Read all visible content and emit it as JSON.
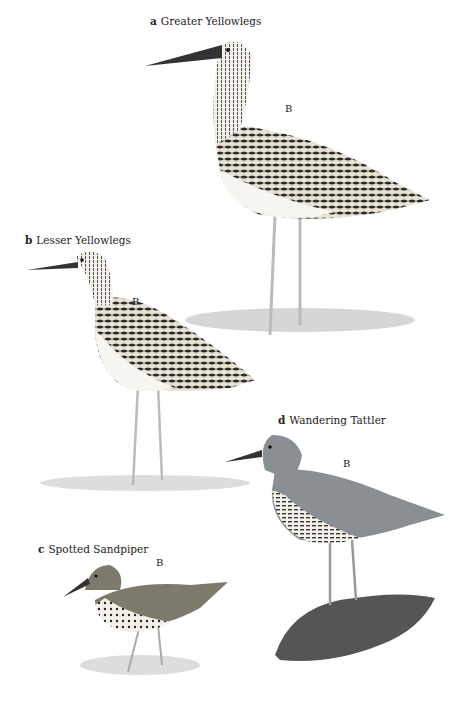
{
  "plate": {
    "species": [
      {
        "letter": "a",
        "name": "Greater Yellowlegs",
        "plumage_mark": "B"
      },
      {
        "letter": "b",
        "name": "Lesser Yellowlegs",
        "plumage_mark": "B"
      },
      {
        "letter": "c",
        "name": "Spotted Sandpiper",
        "plumage_mark": "B"
      },
      {
        "letter": "d",
        "name": "Wandering Tattler",
        "plumage_mark": "B"
      }
    ]
  }
}
